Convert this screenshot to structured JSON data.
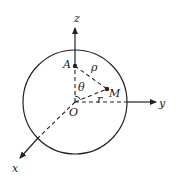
{
  "diagram": {
    "type": "3d-coordinate-sphere",
    "colors": {
      "stroke": "#222222",
      "background": "#ffffff"
    },
    "axes": {
      "z": {
        "label": "z"
      },
      "y": {
        "label": "y"
      },
      "x": {
        "label": "x"
      }
    },
    "points": {
      "origin": {
        "label": "O"
      },
      "A": {
        "label": "A"
      },
      "M": {
        "label": "M"
      }
    },
    "annotations": {
      "rho": "ρ",
      "theta": "θ",
      "r": "r"
    }
  }
}
